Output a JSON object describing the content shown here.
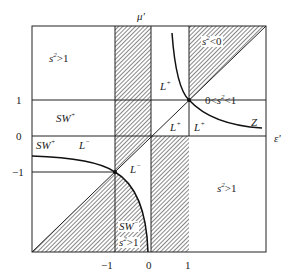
{
  "axes": {
    "x_label": "ε'",
    "y_label": "μ'",
    "x_ticks": [
      "−1",
      "0",
      "1"
    ],
    "y_ticks": [
      "1",
      "0",
      "−1"
    ]
  },
  "regions": {
    "top_left": {
      "base": "s",
      "sup": "2",
      "rest": ">1"
    },
    "sw_plus_mid": {
      "base": "SW",
      "sup": "+"
    },
    "sw_plus_low": {
      "base": "SW",
      "sup": "+"
    },
    "l_minus_left": {
      "base": "L",
      "sup": "−"
    },
    "l_minus_center": {
      "base": "L",
      "sup": "−"
    },
    "top_right_s": {
      "base": "s",
      "sup": "2",
      "rest": "<0"
    },
    "l_plus_top": {
      "base": "L",
      "sup": "+"
    },
    "zero_s_one": {
      "pre": "0<s",
      "sup": "2",
      "rest": "<1"
    },
    "z_label": "Z",
    "l_plus_low_a": {
      "base": "L",
      "sup": "+"
    },
    "l_plus_low_b": {
      "base": "L",
      "sup": "+"
    },
    "sw_minus": {
      "base": "SW",
      "sup": "−"
    },
    "bottom_s": {
      "base": "s",
      "sup": "2",
      "rest": ">1"
    },
    "bottom_right_s": {
      "base": "s",
      "sup": "2",
      "rest": ">1"
    }
  },
  "colors": {
    "line": "#222222",
    "hatch": "#555555",
    "background": "#ffffff"
  }
}
